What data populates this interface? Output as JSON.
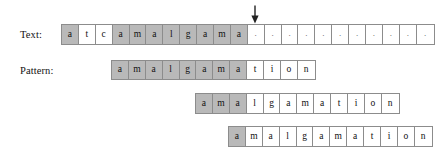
{
  "figure": {
    "labels": {
      "text": "Text:",
      "pattern": "Pattern:"
    },
    "colors": {
      "shaded_cell": "#b9b9b9",
      "plain_cell": "#ffffff",
      "border": "#8c8c8c",
      "ink": "#111111",
      "background": "#ffffff"
    },
    "arrow": {
      "name": "mismatch-arrow",
      "direction": "down",
      "points_at_index": 11
    },
    "rows": [
      {
        "id": "text-row",
        "label": "Text:",
        "left": 61,
        "top": 24,
        "cells": [
          {
            "char": "a",
            "shaded": true
          },
          {
            "char": "t",
            "shaded": false
          },
          {
            "char": "c",
            "shaded": false
          },
          {
            "char": "a",
            "shaded": true
          },
          {
            "char": "m",
            "shaded": true
          },
          {
            "char": "a",
            "shaded": true
          },
          {
            "char": "l",
            "shaded": true
          },
          {
            "char": "g",
            "shaded": true
          },
          {
            "char": "a",
            "shaded": true
          },
          {
            "char": "m",
            "shaded": true
          },
          {
            "char": "a",
            "shaded": true
          },
          {
            "char": ".",
            "shaded": false
          },
          {
            "char": ".",
            "shaded": false
          },
          {
            "char": ".",
            "shaded": false
          },
          {
            "char": ".",
            "shaded": false
          },
          {
            "char": ".",
            "shaded": false
          },
          {
            "char": ".",
            "shaded": false
          },
          {
            "char": ".",
            "shaded": false
          },
          {
            "char": ".",
            "shaded": false
          },
          {
            "char": ".",
            "shaded": false
          },
          {
            "char": ".",
            "shaded": false
          },
          {
            "char": ".",
            "shaded": false
          }
        ]
      },
      {
        "id": "pattern-row-1",
        "label": "Pattern:",
        "left": 111,
        "top": 60,
        "cells": [
          {
            "char": "a",
            "shaded": true
          },
          {
            "char": "m",
            "shaded": true
          },
          {
            "char": "a",
            "shaded": true
          },
          {
            "char": "l",
            "shaded": true
          },
          {
            "char": "g",
            "shaded": true
          },
          {
            "char": "a",
            "shaded": true
          },
          {
            "char": "m",
            "shaded": true
          },
          {
            "char": "a",
            "shaded": true
          },
          {
            "char": "t",
            "shaded": false
          },
          {
            "char": "i",
            "shaded": false
          },
          {
            "char": "o",
            "shaded": false
          },
          {
            "char": "n",
            "shaded": false
          }
        ]
      },
      {
        "id": "pattern-row-2",
        "label": "",
        "left": 195,
        "top": 93,
        "cells": [
          {
            "char": "a",
            "shaded": true
          },
          {
            "char": "m",
            "shaded": true
          },
          {
            "char": "a",
            "shaded": true
          },
          {
            "char": "l",
            "shaded": false
          },
          {
            "char": "g",
            "shaded": false
          },
          {
            "char": "a",
            "shaded": false
          },
          {
            "char": "m",
            "shaded": false
          },
          {
            "char": "a",
            "shaded": false
          },
          {
            "char": "t",
            "shaded": false
          },
          {
            "char": "i",
            "shaded": false
          },
          {
            "char": "o",
            "shaded": false
          },
          {
            "char": "n",
            "shaded": false
          }
        ]
      },
      {
        "id": "pattern-row-3",
        "label": "",
        "left": 228,
        "top": 126,
        "cells": [
          {
            "char": "a",
            "shaded": true
          },
          {
            "char": "m",
            "shaded": false
          },
          {
            "char": "a",
            "shaded": false
          },
          {
            "char": "l",
            "shaded": false
          },
          {
            "char": "g",
            "shaded": false
          },
          {
            "char": "a",
            "shaded": false
          },
          {
            "char": "m",
            "shaded": false
          },
          {
            "char": "a",
            "shaded": false
          },
          {
            "char": "t",
            "shaded": false
          },
          {
            "char": "i",
            "shaded": false
          },
          {
            "char": "o",
            "shaded": false
          },
          {
            "char": "n",
            "shaded": false
          }
        ]
      }
    ]
  }
}
